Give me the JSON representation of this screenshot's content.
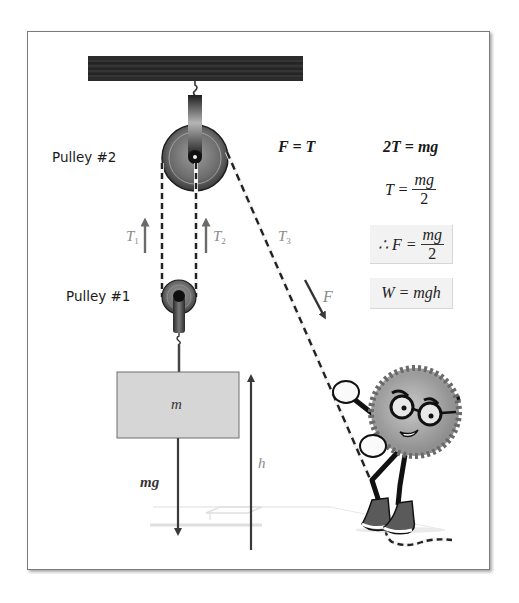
{
  "diagram": {
    "type": "pulley-system",
    "labels": {
      "pulley2": "Pulley #2",
      "pulley1": "Pulley #1",
      "t1": "T",
      "t1_sub": "1",
      "t2": "T",
      "t2_sub": "2",
      "t3": "T",
      "t3_sub": "3",
      "force": "F",
      "mass": "m",
      "weight": "mg",
      "height": "h"
    },
    "equations": {
      "f_equals_t": "F = T",
      "two_t": "2T = mg",
      "t_lhs": "T =",
      "t_num": "mg",
      "t_den": "2",
      "therefore_lhs": "∴ F =",
      "therefore_num": "mg",
      "therefore_den": "2",
      "work": "W = mgh"
    },
    "colors": {
      "beam": "#2a2a2a",
      "pulley": "#6b6b6b",
      "mass_fill": "#d9d9d9",
      "arrow": "#555555",
      "equation_box": "#f2f2f2",
      "character_body": "#9a9a9a"
    }
  }
}
